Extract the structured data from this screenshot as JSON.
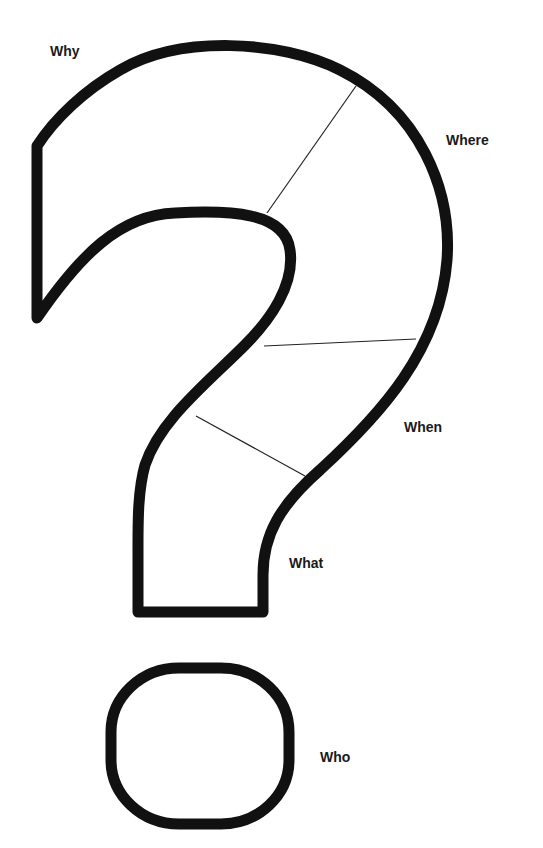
{
  "diagram": {
    "type": "question-mark-graphic-organizer",
    "outline_color": "#111111",
    "divider_color": "#222222",
    "background": "#ffffff",
    "labels": {
      "why": "Why",
      "where": "Where",
      "when": "When",
      "what": "What",
      "who": "Who"
    },
    "sections": [
      {
        "id": "why",
        "region": "upper-left hook"
      },
      {
        "id": "where",
        "region": "upper-right curve"
      },
      {
        "id": "when",
        "region": "middle bend"
      },
      {
        "id": "what",
        "region": "lower stem"
      },
      {
        "id": "who",
        "region": "dot"
      }
    ]
  }
}
